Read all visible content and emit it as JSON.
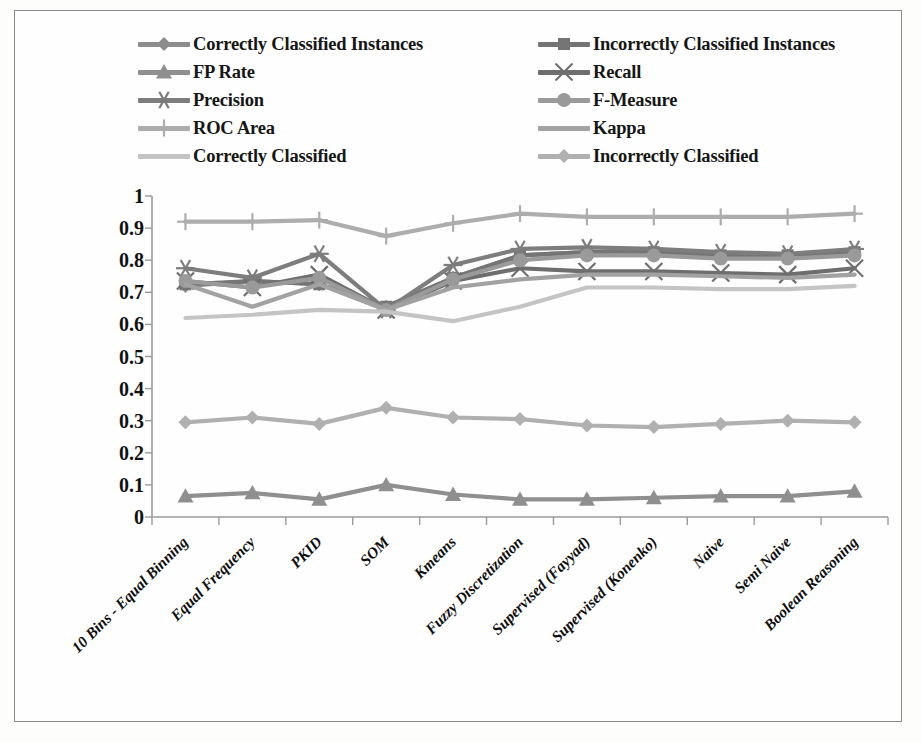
{
  "chart_data": {
    "type": "line",
    "title": "",
    "xlabel": "",
    "ylabel": "",
    "ylim": [
      0,
      1
    ],
    "yticks": [
      "0",
      "0.1",
      "0.2",
      "0.3",
      "0.4",
      "0.5",
      "0.6",
      "0.7",
      "0.8",
      "0.9",
      "1"
    ],
    "grid": false,
    "legend_position": "top",
    "categories": [
      "10 Bins - Equal Binning",
      "Equal Frequency",
      "PKID",
      "SOM",
      "Kmeans",
      "Fuzzy Discretization",
      "Supervised (Fayyad)",
      "Supervised (Konenko)",
      "Naive",
      "Semi Naive",
      "Boolean Reasoning"
    ],
    "series": [
      {
        "name": "Correctly Classified Instances",
        "marker": "diamond",
        "color": "#8c8c8c",
        "values": [
          0.72,
          0.735,
          0.725,
          0.655,
          0.745,
          0.815,
          0.825,
          0.825,
          0.815,
          0.815,
          0.825
        ]
      },
      {
        "name": "Incorrectly Classified Instances",
        "marker": "square",
        "color": "#757575",
        "values": [
          0.725,
          0.735,
          0.725,
          0.655,
          0.745,
          0.815,
          0.825,
          0.825,
          0.815,
          0.815,
          0.825
        ]
      },
      {
        "name": "FP Rate",
        "marker": "triangle",
        "color": "#8f8f8f",
        "values": [
          0.065,
          0.075,
          0.055,
          0.1,
          0.07,
          0.055,
          0.055,
          0.06,
          0.065,
          0.065,
          0.08
        ]
      },
      {
        "name": "Recall",
        "marker": "cross",
        "color": "#6e6e6e",
        "values": [
          0.735,
          0.715,
          0.755,
          0.645,
          0.735,
          0.775,
          0.765,
          0.765,
          0.76,
          0.755,
          0.775
        ]
      },
      {
        "name": "Precision",
        "marker": "asterisk",
        "color": "#7d7d7d",
        "values": [
          0.775,
          0.745,
          0.82,
          0.645,
          0.785,
          0.835,
          0.84,
          0.835,
          0.825,
          0.82,
          0.835
        ]
      },
      {
        "name": "F-Measure",
        "marker": "circle",
        "color": "#9a9a9a",
        "values": [
          0.735,
          0.715,
          0.745,
          0.645,
          0.74,
          0.8,
          0.815,
          0.815,
          0.805,
          0.805,
          0.815
        ]
      },
      {
        "name": "ROC Area",
        "marker": "plus",
        "color": "#adadad",
        "values": [
          0.92,
          0.92,
          0.925,
          0.875,
          0.915,
          0.945,
          0.935,
          0.935,
          0.935,
          0.935,
          0.945
        ]
      },
      {
        "name": "Kappa",
        "marker": "none",
        "color": "#a2a2a2",
        "values": [
          0.725,
          0.655,
          0.725,
          0.645,
          0.715,
          0.74,
          0.755,
          0.755,
          0.75,
          0.745,
          0.755
        ]
      },
      {
        "name": "Correctly Classified",
        "marker": "none",
        "color": "#c4c4c4",
        "values": [
          0.62,
          0.63,
          0.645,
          0.64,
          0.61,
          0.655,
          0.715,
          0.715,
          0.71,
          0.71,
          0.72
        ]
      },
      {
        "name": "Incorrectly Classified",
        "marker": "diamond",
        "color": "#b0b0b0",
        "values": [
          0.295,
          0.31,
          0.29,
          0.34,
          0.31,
          0.305,
          0.285,
          0.28,
          0.29,
          0.3,
          0.295
        ]
      }
    ]
  },
  "legend": {
    "entries": [
      "Correctly Classified Instances",
      "Incorrectly Classified Instances",
      "FP Rate",
      "Recall",
      "Precision",
      "F-Measure",
      "ROC Area",
      "Kappa",
      "Correctly Classified",
      "Incorrectly Classified"
    ]
  },
  "axis": {
    "frame_color": "#8a8a8a",
    "tick_color": "#9a9a9a"
  }
}
